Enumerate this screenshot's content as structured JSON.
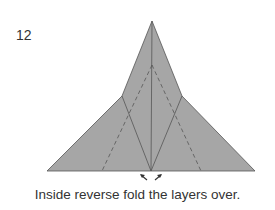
{
  "step_number": "12",
  "caption": "Inside reverse fold the layers over.",
  "colors": {
    "paper": "#a6a6a6",
    "line": "#555555",
    "text": "#333333"
  }
}
